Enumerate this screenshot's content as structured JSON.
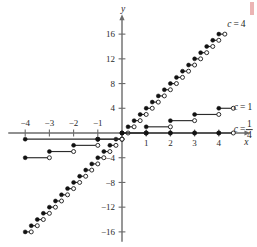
{
  "figure": {
    "background_color": "#ffffff",
    "axis_color": "#6b6b6b",
    "curve_color": "#2b2b2b",
    "corner_mark_color": "#e8a7a7"
  },
  "axes": {
    "x_label": "x",
    "y_label": "y",
    "x_ticks": [
      {
        "value": -4,
        "label": "−4"
      },
      {
        "value": -3,
        "label": "−3"
      },
      {
        "value": -2,
        "label": "−2"
      },
      {
        "value": -1,
        "label": "−1"
      },
      {
        "value": 1,
        "label": "1"
      },
      {
        "value": 2,
        "label": "2"
      },
      {
        "value": 3,
        "label": "3"
      },
      {
        "value": 4,
        "label": "4"
      }
    ],
    "y_ticks": [
      {
        "value": 16,
        "label": "16"
      },
      {
        "value": 12,
        "label": "12"
      },
      {
        "value": 8,
        "label": "8"
      },
      {
        "value": 4,
        "label": "4"
      },
      {
        "value": -4,
        "label": "−4"
      },
      {
        "value": -8,
        "label": "−8"
      },
      {
        "value": -12,
        "label": "−12"
      },
      {
        "value": -16,
        "label": "−16"
      }
    ],
    "xlim": [
      -4.7,
      5.1
    ],
    "ylim": [
      -17.6,
      18.4
    ]
  },
  "labels": {
    "c4": {
      "prefix": "c",
      "equals": "=",
      "value": "4"
    },
    "c1": {
      "prefix": "c",
      "equals": "=",
      "value": "1"
    },
    "cquarter": {
      "prefix": "c",
      "equals": "=",
      "numerator": "1",
      "denominator": "4"
    }
  },
  "chart_data": {
    "type": "line",
    "title": "",
    "xlabel": "x",
    "ylabel": "y",
    "xlim": [
      -4.7,
      5.1
    ],
    "ylim": [
      -17.6,
      18.4
    ],
    "grid": false,
    "legend_position": "inline-right",
    "series": [
      {
        "name": "c = 4",
        "label": "c = 4",
        "step_width": 0.25,
        "step_height": 1,
        "marker_left": "closed",
        "marker_right": "open",
        "steps": [
          {
            "x0": -4.0,
            "x1": -3.75,
            "y": -16
          },
          {
            "x0": -3.75,
            "x1": -3.5,
            "y": -15
          },
          {
            "x0": -3.5,
            "x1": -3.25,
            "y": -14
          },
          {
            "x0": -3.25,
            "x1": -3.0,
            "y": -13
          },
          {
            "x0": -3.0,
            "x1": -2.75,
            "y": -12
          },
          {
            "x0": -2.75,
            "x1": -2.5,
            "y": -11
          },
          {
            "x0": -2.5,
            "x1": -2.25,
            "y": -10
          },
          {
            "x0": -2.25,
            "x1": -2.0,
            "y": -9
          },
          {
            "x0": -2.0,
            "x1": -1.75,
            "y": -8
          },
          {
            "x0": -1.75,
            "x1": -1.5,
            "y": -7
          },
          {
            "x0": -1.5,
            "x1": -1.25,
            "y": -6
          },
          {
            "x0": -1.25,
            "x1": -1.0,
            "y": -5
          },
          {
            "x0": -1.0,
            "x1": -0.75,
            "y": -4
          },
          {
            "x0": -0.75,
            "x1": -0.5,
            "y": -3
          },
          {
            "x0": -0.5,
            "x1": -0.25,
            "y": -2
          },
          {
            "x0": -0.25,
            "x1": 0.0,
            "y": -1
          },
          {
            "x0": 0.0,
            "x1": 0.25,
            "y": 0
          },
          {
            "x0": 0.25,
            "x1": 0.5,
            "y": 1
          },
          {
            "x0": 0.5,
            "x1": 0.75,
            "y": 2
          },
          {
            "x0": 0.75,
            "x1": 1.0,
            "y": 3
          },
          {
            "x0": 1.0,
            "x1": 1.25,
            "y": 4
          },
          {
            "x0": 1.25,
            "x1": 1.5,
            "y": 5
          },
          {
            "x0": 1.5,
            "x1": 1.75,
            "y": 6
          },
          {
            "x0": 1.75,
            "x1": 2.0,
            "y": 7
          },
          {
            "x0": 2.0,
            "x1": 2.25,
            "y": 8
          },
          {
            "x0": 2.25,
            "x1": 2.5,
            "y": 9
          },
          {
            "x0": 2.5,
            "x1": 2.75,
            "y": 10
          },
          {
            "x0": 2.75,
            "x1": 3.0,
            "y": 11
          },
          {
            "x0": 3.0,
            "x1": 3.25,
            "y": 12
          },
          {
            "x0": 3.25,
            "x1": 3.5,
            "y": 13
          },
          {
            "x0": 3.5,
            "x1": 3.75,
            "y": 14
          },
          {
            "x0": 3.75,
            "x1": 4.0,
            "y": 15
          },
          {
            "x0": 4.0,
            "x1": 4.25,
            "y": 16
          }
        ]
      },
      {
        "name": "c = 1",
        "label": "c = 1",
        "step_width": 1,
        "step_height": 1,
        "marker_left": "closed",
        "marker_right": "open",
        "steps": [
          {
            "x0": -4,
            "x1": -3,
            "y": -4
          },
          {
            "x0": -3,
            "x1": -2,
            "y": -3
          },
          {
            "x0": -2,
            "x1": -1,
            "y": -2
          },
          {
            "x0": -1,
            "x1": 0,
            "y": -1
          },
          {
            "x0": 0,
            "x1": 1,
            "y": 0
          },
          {
            "x0": 1,
            "x1": 2,
            "y": 1
          },
          {
            "x0": 2,
            "x1": 3,
            "y": 2
          },
          {
            "x0": 3,
            "x1": 4,
            "y": 3
          },
          {
            "x0": 4,
            "x1": 4.6,
            "y": 4
          }
        ]
      },
      {
        "name": "c = 1/4",
        "label": "c = 1/4",
        "step_width": 1,
        "step_height": 1,
        "marker_left": "closed",
        "marker_right": "open",
        "steps": [
          {
            "x0": -4,
            "x1": -1,
            "y": -1
          },
          {
            "x0": -1,
            "x1": 0,
            "y": -1
          },
          {
            "x0": 0,
            "x1": 1,
            "y": 0
          },
          {
            "x0": 1,
            "x1": 2,
            "y": 0
          },
          {
            "x0": 2,
            "x1": 3,
            "y": 0
          },
          {
            "x0": 3,
            "x1": 4,
            "y": 0
          },
          {
            "x0": 4,
            "x1": 4.6,
            "y": 0
          }
        ]
      }
    ]
  }
}
